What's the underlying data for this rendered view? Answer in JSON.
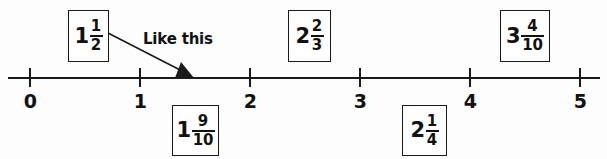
{
  "worksheet": {
    "type": "number-line-placement-exercise",
    "background_color": "#fdfdfd",
    "ink_color": "#1a1a1a"
  },
  "number_line": {
    "name": "number-line",
    "min": 0,
    "max": 5,
    "ticks": [
      {
        "value": "0",
        "x": 30
      },
      {
        "value": "1",
        "x": 140
      },
      {
        "value": "2",
        "x": 250
      },
      {
        "value": "3",
        "x": 360
      },
      {
        "value": "4",
        "x": 470
      },
      {
        "value": "5",
        "x": 580
      }
    ],
    "line_start_x": 8,
    "line_end_x": 600,
    "line_y": 78
  },
  "annotation": {
    "label": "Like this",
    "pointer_from_x": 108,
    "pointer_from_y": 33,
    "pointer_to_x": 188,
    "pointer_to_y": 77,
    "points_to_value": "1 1/2"
  },
  "value_boxes": [
    {
      "id": "box-1-1-2",
      "whole": "1",
      "numerator": "1",
      "denominator": "2",
      "label": "1 1/2",
      "position": "above",
      "x": 68,
      "y": 10,
      "width": 41,
      "height": 52
    },
    {
      "id": "box-1-9-10",
      "whole": "1",
      "numerator": "9",
      "denominator": "10",
      "label": "1 9/10",
      "position": "below",
      "x": 172,
      "y": 105,
      "width": 47,
      "height": 51
    },
    {
      "id": "box-2-2-3",
      "whole": "2",
      "numerator": "2",
      "denominator": "3",
      "label": "2 2/3",
      "position": "above",
      "x": 288,
      "y": 10,
      "width": 43,
      "height": 52
    },
    {
      "id": "box-2-1-4",
      "whole": "2",
      "numerator": "1",
      "denominator": "4",
      "label": "2 1/4",
      "position": "below",
      "x": 402,
      "y": 105,
      "width": 45,
      "height": 51
    },
    {
      "id": "box-3-4-10",
      "whole": "3",
      "numerator": "4",
      "denominator": "10",
      "label": "3 4/10",
      "position": "above",
      "x": 500,
      "y": 10,
      "width": 50,
      "height": 52
    }
  ]
}
